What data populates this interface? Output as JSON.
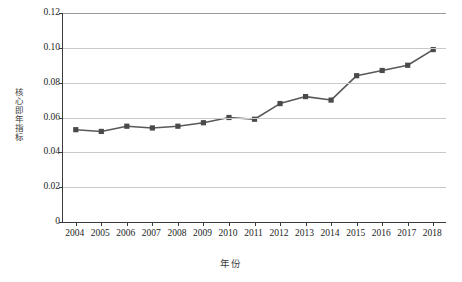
{
  "chart_data": {
    "type": "line",
    "title": "",
    "xlabel": "年份",
    "ylabel": "核心即年指标",
    "categories": [
      "2004",
      "2005",
      "2006",
      "2007",
      "2008",
      "2009",
      "2010",
      "2011",
      "2012",
      "2013",
      "2014",
      "2015",
      "2016",
      "2017",
      "2018"
    ],
    "values": [
      0.053,
      0.052,
      0.055,
      0.054,
      0.055,
      0.057,
      0.06,
      0.059,
      0.068,
      0.072,
      0.07,
      0.084,
      0.087,
      0.09,
      0.099
    ],
    "series": [
      {
        "name": "核心即年指标",
        "values": [
          0.053,
          0.052,
          0.055,
          0.054,
          0.055,
          0.057,
          0.06,
          0.059,
          0.068,
          0.072,
          0.07,
          0.084,
          0.087,
          0.09,
          0.099
        ]
      }
    ],
    "ylim": [
      0,
      0.12
    ],
    "yticks": [
      "0",
      "0.02",
      "0.04",
      "0.06",
      "0.08",
      "0.10",
      "0.12"
    ],
    "ytick_values": [
      0,
      0.02,
      0.04,
      0.06,
      0.08,
      0.1,
      0.12
    ],
    "grid": "horizontal",
    "legend": "none",
    "marker": "square",
    "colors": {
      "line": "#595959",
      "marker": "#4a4a4a",
      "grid": "#c9c9c9",
      "axis": "#3a3a3a",
      "background": "#ffffff",
      "text": "#242424"
    }
  }
}
